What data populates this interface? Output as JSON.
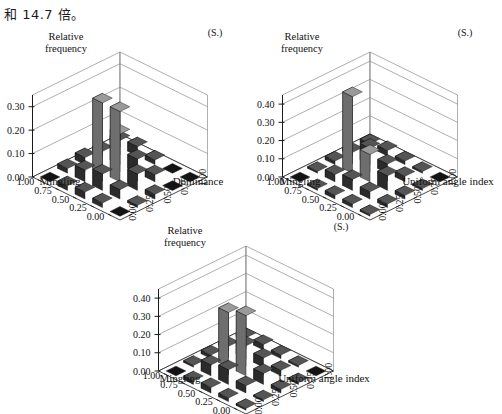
{
  "header": {
    "note": "和 14.7 倍。"
  },
  "charts": [
    {
      "id": "chart-mingling-dominance",
      "corner_tag": "(S.)",
      "zlabel_line1": "Relative",
      "zlabel_line2": "frequency",
      "zticks": [
        "0.00",
        "0.10",
        "0.20",
        "0.30"
      ],
      "zlim": [
        0,
        0.35
      ],
      "xlabel": "Dominance",
      "ylabel": "Mingling",
      "xticks": [
        "0.00",
        "0.25",
        "0.50",
        "0.75",
        "1.00"
      ],
      "yticks": [
        "1.00",
        "0.75",
        "0.50",
        "0.25",
        "0.00"
      ]
    },
    {
      "id": "chart-mingling-uniformangle-a",
      "corner_tag": "(S.)",
      "zlabel_line1": "Relative",
      "zlabel_line2": "frequency",
      "zticks": [
        "0.00",
        "0.10",
        "0.20",
        "0.30",
        "0.40"
      ],
      "zlim": [
        0,
        0.45
      ],
      "xlabel": "Uniform angle index",
      "ylabel": "Mingling",
      "xticks": [
        "0.00",
        "0.25",
        "0.50",
        "0.75",
        "1.00"
      ],
      "yticks": [
        "1.00",
        "0.75",
        "0.50",
        "0.25",
        "0.00"
      ]
    },
    {
      "id": "chart-mingling-uniformangle-b",
      "corner_tag": "(S.)",
      "zlabel_line1": "Relative",
      "zlabel_line2": "frequency",
      "zticks": [
        "0.00",
        "0.10",
        "0.20",
        "0.30",
        "0.40"
      ],
      "zlim": [
        0,
        0.45
      ],
      "xlabel": "Uniform angle index",
      "ylabel": "Mingling",
      "xticks": [
        "0.00",
        "0.25",
        "0.50",
        "0.75",
        "1.00"
      ],
      "yticks": [
        "1.00",
        "0.75",
        "0.50",
        "0.25",
        "0.00"
      ]
    }
  ],
  "chart_data": [
    {
      "type": "bar",
      "title": "",
      "subtitle": "(S.)",
      "xlabel": "Dominance",
      "ylabel": "Mingling",
      "zlabel": "Relative frequency",
      "x_categories": [
        "0.00",
        "0.25",
        "0.50",
        "0.75",
        "1.00"
      ],
      "y_categories": [
        "0.00",
        "0.25",
        "0.50",
        "0.75",
        "1.00"
      ],
      "zlim": [
        0,
        0.35
      ],
      "zticks": [
        0.0,
        0.1,
        0.2,
        0.3
      ],
      "grid": true,
      "legend": "none",
      "note": "values[y_index][x_index]; y_index 0 = Mingling 0.00 (front row), x_index 0 = Dominance 0.00",
      "values": [
        [
          0.0,
          0.02,
          0.03,
          0.02,
          0.0
        ],
        [
          0.02,
          0.05,
          0.07,
          0.04,
          0.01
        ],
        [
          0.03,
          0.3,
          0.3,
          0.07,
          0.02
        ],
        [
          0.02,
          0.13,
          0.06,
          0.03,
          0.0
        ],
        [
          0.03,
          0.04,
          0.02,
          0.0,
          0.0
        ]
      ]
    },
    {
      "type": "bar",
      "title": "",
      "subtitle": "(S.)",
      "xlabel": "Uniform angle index",
      "ylabel": "Mingling",
      "zlabel": "Relative frequency",
      "x_categories": [
        "0.00",
        "0.25",
        "0.50",
        "0.75",
        "1.00"
      ],
      "y_categories": [
        "0.00",
        "0.25",
        "0.50",
        "0.75",
        "1.00"
      ],
      "zlim": [
        0,
        0.45
      ],
      "zticks": [
        0.0,
        0.1,
        0.2,
        0.3,
        0.4
      ],
      "grid": true,
      "legend": "none",
      "note": "values[y_index][x_index]; y_index 0 = Mingling 0.00 (front row), x_index 0 = Uniform angle index 0.00",
      "values": [
        [
          0.0,
          0.01,
          0.02,
          0.02,
          0.01
        ],
        [
          0.01,
          0.04,
          0.06,
          0.04,
          0.02
        ],
        [
          0.02,
          0.42,
          0.15,
          0.08,
          0.02
        ],
        [
          0.02,
          0.09,
          0.05,
          0.03,
          0.01
        ],
        [
          0.02,
          0.03,
          0.02,
          0.01,
          0.0
        ]
      ]
    },
    {
      "type": "bar",
      "title": "",
      "subtitle": "(S.)",
      "xlabel": "Uniform angle index",
      "ylabel": "Mingling",
      "zlabel": "Relative frequency",
      "x_categories": [
        "0.00",
        "0.25",
        "0.50",
        "0.75",
        "1.00"
      ],
      "y_categories": [
        "0.00",
        "0.25",
        "0.50",
        "0.75",
        "1.00"
      ],
      "zlim": [
        0,
        0.45
      ],
      "zticks": [
        0.0,
        0.1,
        0.2,
        0.3,
        0.4
      ],
      "grid": true,
      "legend": "none",
      "note": "values[y_index][x_index]; y_index 0 = Mingling 0.00 (front row), x_index 0 = Uniform angle index 0.00",
      "values": [
        [
          0.0,
          0.02,
          0.03,
          0.02,
          0.01
        ],
        [
          0.01,
          0.06,
          0.08,
          0.04,
          0.01
        ],
        [
          0.02,
          0.3,
          0.33,
          0.06,
          0.02
        ],
        [
          0.02,
          0.07,
          0.05,
          0.03,
          0.01
        ],
        [
          0.02,
          0.03,
          0.02,
          0.01,
          0.0
        ]
      ]
    }
  ],
  "colors": {
    "bar_front": "#2b2b2b",
    "bar_side": "#101010",
    "bar_top": "#555555",
    "bar_tall_front": "#6e6e6e",
    "bar_tall_side": "#3a3a3a",
    "bar_tall_top": "#9a9a9a",
    "floor": "#fdfdfd",
    "grid_line": "#8d8d8d",
    "axis_line": "#1a1a1a",
    "text": "#111111"
  }
}
